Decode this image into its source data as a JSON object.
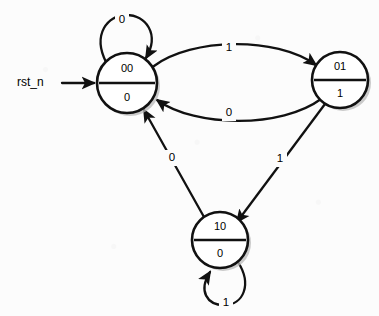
{
  "diagram": {
    "type": "finite-state-machine",
    "title": "",
    "reset": {
      "label": "rst_n",
      "target_state": "00"
    },
    "states": [
      {
        "id": "s00",
        "name": "00",
        "output": "0",
        "cx": 127,
        "cy": 83,
        "r": 30
      },
      {
        "id": "s01",
        "name": "01",
        "output": "1",
        "cx": 340,
        "cy": 80,
        "r": 28
      },
      {
        "id": "s10",
        "name": "10",
        "output": "0",
        "cx": 220,
        "cy": 240,
        "r": 28
      }
    ],
    "transitions": [
      {
        "id": "t-00-00",
        "from": "00",
        "to": "00",
        "label": "0",
        "kind": "self-loop",
        "label_x": 122,
        "label_y": 20
      },
      {
        "id": "t-00-01",
        "from": "00",
        "to": "01",
        "label": "1",
        "kind": "arc",
        "label_x": 229,
        "label_y": 48
      },
      {
        "id": "t-01-00",
        "from": "01",
        "to": "00",
        "label": "0",
        "kind": "arc",
        "label_x": 229,
        "label_y": 113
      },
      {
        "id": "t-01-10",
        "from": "01",
        "to": "10",
        "label": "1",
        "kind": "line",
        "label_x": 280,
        "label_y": 159
      },
      {
        "id": "t-10-00",
        "from": "10",
        "to": "00",
        "label": "0",
        "kind": "line",
        "label_x": 172,
        "label_y": 158
      },
      {
        "id": "t-10-10",
        "from": "10",
        "to": "10",
        "label": "1",
        "kind": "self-loop",
        "label_x": 226,
        "label_y": 303
      }
    ],
    "colors": {
      "stroke": "#111111",
      "fill": "#ffffff",
      "shadow": "#b9b9b9",
      "background": "#fcfcfc"
    }
  }
}
